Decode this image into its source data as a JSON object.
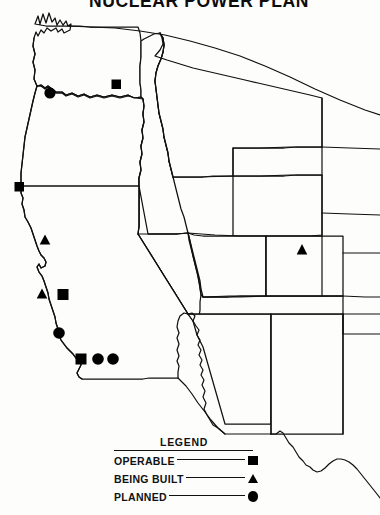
{
  "title": "NUCLEAR POWER PLAN",
  "map": {
    "region_name": "Western United States",
    "markers": [
      {
        "type": "planned",
        "symbol": "circle",
        "x": 50,
        "y": 93,
        "state": "Washington"
      },
      {
        "type": "operable",
        "symbol": "square",
        "x": 116,
        "y": 84,
        "state": "Washington"
      },
      {
        "type": "operable",
        "symbol": "square",
        "x": 19,
        "y": 187,
        "state": "California"
      },
      {
        "type": "being_built",
        "symbol": "triangle",
        "x": 45,
        "y": 240,
        "state": "California"
      },
      {
        "type": "being_built",
        "symbol": "triangle",
        "x": 42,
        "y": 294,
        "state": "California"
      },
      {
        "type": "operable",
        "symbol": "square",
        "x": 63,
        "y": 294,
        "state": "California"
      },
      {
        "type": "planned",
        "symbol": "circle",
        "x": 59,
        "y": 333,
        "state": "California"
      },
      {
        "type": "operable",
        "symbol": "square",
        "x": 81,
        "y": 359,
        "state": "California"
      },
      {
        "type": "planned",
        "symbol": "circle",
        "x": 98,
        "y": 359,
        "state": "California"
      },
      {
        "type": "planned",
        "symbol": "circle",
        "x": 113,
        "y": 359,
        "state": "California"
      },
      {
        "type": "being_built",
        "symbol": "triangle",
        "x": 302,
        "y": 250,
        "state": "Colorado"
      }
    ]
  },
  "legend": {
    "title": "LEGEND",
    "rows": [
      {
        "label": "OPERABLE",
        "symbol": "square"
      },
      {
        "label": "BEING BUILT",
        "symbol": "triangle"
      },
      {
        "label": "PLANNED",
        "symbol": "circle"
      }
    ]
  }
}
